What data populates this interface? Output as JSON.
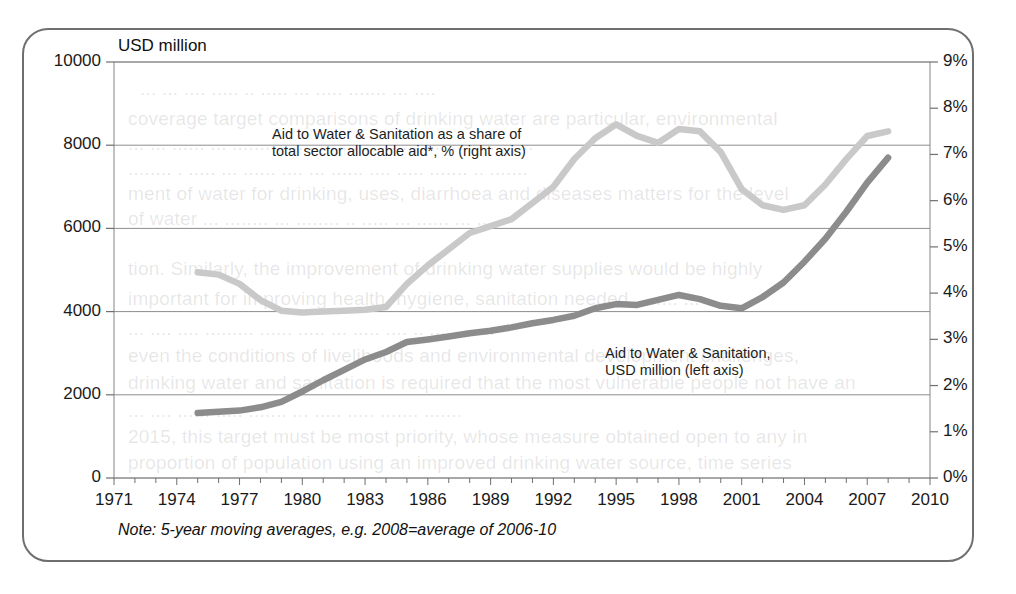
{
  "page": {
    "top_cut_text": "p .                                                      ,        g"
  },
  "bleed_lines": [
    {
      "x": 140,
      "y": 78,
      "text": "... ... .... ..... .. ..... ... ..... ....... ... ...."
    },
    {
      "x": 128,
      "y": 108,
      "text": "coverage target comparisons of drinking water are particular, environmental"
    },
    {
      "x": 128,
      "y": 133,
      "text": "... ... ...... ... ........ .... ......... .. ..... ..... ... ...... . ..."
    },
    {
      "x": 128,
      "y": 158,
      "text": "........ . ..... ... ...... .... ... ...... .... ..... ....... .. ......."
    },
    {
      "x": 128,
      "y": 183,
      "text": "ment of water for drinking, uses, diarrhoea and diseases matters for the level"
    },
    {
      "x": 128,
      "y": 208,
      "text": "of water ... ........ ... ........ .. ..... ... ...... ... ..."
    },
    {
      "x": 128,
      "y": 258,
      "text": "tion. Similarly, the improvement of drinking water supplies would be  highly"
    },
    {
      "x": 128,
      "y": 288,
      "text": "important for improving health, hygiene, sanitation needed. ....... ... ...."
    },
    {
      "x": 128,
      "y": 318,
      "text": "... .... .... ......... ...... ..... ... ..... .... .. .... ......."
    },
    {
      "x": 128,
      "y": 345,
      "text": "even the conditions of livelihoods and environmental development challenges,"
    },
    {
      "x": 128,
      "y": 372,
      "text": "drinking water and sanitation is required that the most vulnerable people not have an"
    },
    {
      "x": 128,
      "y": 400,
      "text": "... .... ...... ..... ....... ... ..... ..... ....... ......."
    },
    {
      "x": 128,
      "y": 426,
      "text": "2015, this target must be most priority, whose measure obtained open to any in"
    },
    {
      "x": 128,
      "y": 452,
      "text": "proportion of population using an improved drinking water source, time series"
    }
  ],
  "chart_data": {
    "type": "line",
    "title": "",
    "note": "Note: 5-year moving averages, e.g. 2008=average of 2006-10",
    "left_axis": {
      "label": "USD million",
      "ticks": [
        0,
        2000,
        4000,
        6000,
        8000,
        10000
      ],
      "tick_labels": [
        "0",
        "2000",
        "4000",
        "6000",
        "8000",
        "10000"
      ],
      "min": 0,
      "max": 10000
    },
    "right_axis": {
      "label": "%",
      "ticks": [
        0,
        1,
        2,
        3,
        4,
        5,
        6,
        7,
        8,
        9
      ],
      "tick_labels": [
        "0%",
        "1%",
        "2%",
        "3%",
        "4%",
        "5%",
        "6%",
        "7%",
        "8%",
        "9%"
      ],
      "min": 0,
      "max": 9
    },
    "xlabel": "",
    "x_min": 1971,
    "x_max": 2010,
    "x_tick_labels": [
      "1971",
      "1974",
      "1977",
      "1980",
      "1983",
      "1986",
      "1989",
      "1992",
      "1995",
      "1998",
      "2001",
      "2004",
      "2007",
      "2010"
    ],
    "x_tick_values": [
      1971,
      1974,
      1977,
      1980,
      1983,
      1986,
      1989,
      1992,
      1995,
      1998,
      2001,
      2004,
      2007,
      2010
    ],
    "x_minor_step": 1,
    "grid": "horizontal",
    "legend_position": "inside-annotations",
    "series": [
      {
        "name": "Aid to Water & Sanitation as a share of total sector allocable aid*, % (right axis)",
        "short_name": "share-of-sector-allocable-aid",
        "axis": "right",
        "unit": "%",
        "color": "#c9c9c9",
        "annotation_line1": "Aid to Water & Sanitation  as a share of",
        "annotation_line2": "total sector allocable aid*, % (right axis)",
        "x": [
          1975,
          1976,
          1977,
          1978,
          1979,
          1980,
          1981,
          1982,
          1983,
          1984,
          1985,
          1986,
          1987,
          1988,
          1989,
          1990,
          1991,
          1992,
          1993,
          1994,
          1995,
          1996,
          1997,
          1998,
          1999,
          2000,
          2001,
          2002,
          2003,
          2004,
          2005,
          2006,
          2007,
          2008
        ],
        "values": [
          4.45,
          4.4,
          4.2,
          3.85,
          3.62,
          3.58,
          3.6,
          3.62,
          3.64,
          3.7,
          4.2,
          4.6,
          4.95,
          5.3,
          5.45,
          5.6,
          5.95,
          6.3,
          6.9,
          7.35,
          7.65,
          7.4,
          7.25,
          7.55,
          7.5,
          7.05,
          6.25,
          5.9,
          5.8,
          5.9,
          6.35,
          6.9,
          7.4,
          7.5
        ]
      },
      {
        "name": "Aid to Water & Sanitation, USD million (left axis)",
        "short_name": "aid-to-water-and-sanitation-usd",
        "axis": "left",
        "unit": "USD million",
        "color": "#8c8c8c",
        "annotation_line1": "Aid to Water & Sanitation,",
        "annotation_line2": "USD million (left axis)",
        "x": [
          1975,
          1976,
          1977,
          1978,
          1979,
          1980,
          1981,
          1982,
          1983,
          1984,
          1985,
          1986,
          1987,
          1988,
          1989,
          1990,
          1991,
          1992,
          1993,
          1994,
          1995,
          1996,
          1997,
          1998,
          1999,
          2000,
          2001,
          2002,
          2003,
          2004,
          2005,
          2006,
          2007,
          2008
        ],
        "values": [
          1560,
          1590,
          1620,
          1700,
          1830,
          2080,
          2350,
          2600,
          2850,
          3030,
          3270,
          3330,
          3400,
          3480,
          3540,
          3620,
          3720,
          3800,
          3900,
          4080,
          4180,
          4160,
          4280,
          4400,
          4300,
          4140,
          4080,
          4350,
          4700,
          5200,
          5750,
          6400,
          7100,
          7700
        ]
      }
    ],
    "footnote_marker": "*"
  }
}
